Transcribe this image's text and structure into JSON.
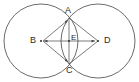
{
  "figure": {
    "canvas": {
      "width": 139,
      "height": 82
    },
    "background_color": "#ffffff",
    "stroke_color": "#4a4a4a",
    "label_color": "#2b2b2b",
    "labels": {
      "a": "A",
      "b": "B",
      "c": "C",
      "d": "D",
      "e": "E"
    },
    "points": {
      "A": {
        "x": 69,
        "y": 18
      },
      "B": {
        "x": 41,
        "y": 41
      },
      "C": {
        "x": 69,
        "y": 64
      },
      "D": {
        "x": 98,
        "y": 41
      },
      "E": {
        "x": 69,
        "y": 41
      }
    },
    "circles": [
      {
        "name": "circle-left",
        "cx": 41,
        "cy": 41,
        "r": 37
      },
      {
        "name": "circle-right",
        "cx": 98,
        "cy": 41,
        "r": 37
      }
    ],
    "segments": [
      {
        "name": "segment-bd",
        "from": "B",
        "to": "D",
        "arrows": "both"
      },
      {
        "name": "segment-ba",
        "from": "B",
        "to": "A",
        "arrows": "to"
      },
      {
        "name": "segment-bc",
        "from": "B",
        "to": "C",
        "arrows": "to"
      },
      {
        "name": "segment-ad",
        "from": "A",
        "to": "D",
        "arrows": "none"
      },
      {
        "name": "segment-cd",
        "from": "C",
        "to": "D",
        "arrows": "none"
      },
      {
        "name": "segment-ac",
        "from": "A",
        "to": "C",
        "arrows": "none"
      }
    ]
  }
}
